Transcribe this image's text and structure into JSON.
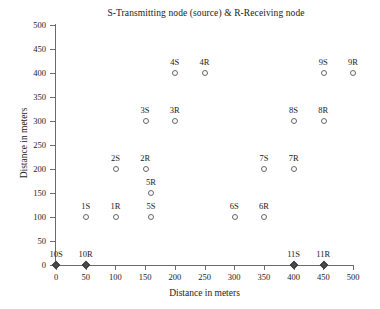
{
  "chart_data": {
    "type": "scatter",
    "title": "S-Transmitting node (source) & R-Receiving node",
    "xlabel": "Distance in meters",
    "ylabel": "Distance in meters",
    "xlim": [
      0,
      500
    ],
    "ylim": [
      0,
      500
    ],
    "xticks": [
      0,
      50,
      100,
      150,
      200,
      250,
      300,
      350,
      400,
      450,
      500
    ],
    "yticks": [
      0,
      50,
      100,
      150,
      200,
      250,
      300,
      350,
      400,
      450,
      500
    ],
    "grid": false,
    "legend": null,
    "marker": "open-circle",
    "points": [
      {
        "label": "1S",
        "x": 50,
        "y": 100,
        "marker": "open-circle"
      },
      {
        "label": "1R",
        "x": 100,
        "y": 100,
        "marker": "open-circle"
      },
      {
        "label": "2S",
        "x": 100,
        "y": 200,
        "marker": "open-circle"
      },
      {
        "label": "2R",
        "x": 150,
        "y": 200,
        "marker": "open-circle"
      },
      {
        "label": "3S",
        "x": 150,
        "y": 300,
        "marker": "open-circle"
      },
      {
        "label": "3R",
        "x": 200,
        "y": 300,
        "marker": "open-circle"
      },
      {
        "label": "4S",
        "x": 200,
        "y": 400,
        "marker": "open-circle"
      },
      {
        "label": "4R",
        "x": 250,
        "y": 400,
        "marker": "open-circle"
      },
      {
        "label": "5S",
        "x": 160,
        "y": 100,
        "marker": "open-circle"
      },
      {
        "label": "5R",
        "x": 160,
        "y": 150,
        "marker": "open-circle"
      },
      {
        "label": "6S",
        "x": 300,
        "y": 100,
        "marker": "open-circle"
      },
      {
        "label": "6R",
        "x": 350,
        "y": 100,
        "marker": "open-circle"
      },
      {
        "label": "7S",
        "x": 350,
        "y": 200,
        "marker": "open-circle"
      },
      {
        "label": "7R",
        "x": 400,
        "y": 200,
        "marker": "open-circle"
      },
      {
        "label": "8S",
        "x": 400,
        "y": 300,
        "marker": "open-circle"
      },
      {
        "label": "8R",
        "x": 450,
        "y": 300,
        "marker": "open-circle"
      },
      {
        "label": "9S",
        "x": 450,
        "y": 400,
        "marker": "open-circle"
      },
      {
        "label": "9R",
        "x": 500,
        "y": 400,
        "marker": "open-circle"
      },
      {
        "label": "10S",
        "x": 0,
        "y": 0,
        "marker": "filled-diamond"
      },
      {
        "label": "10R",
        "x": 50,
        "y": 0,
        "marker": "filled-diamond"
      },
      {
        "label": "11S",
        "x": 400,
        "y": 0,
        "marker": "filled-diamond"
      },
      {
        "label": "11R",
        "x": 450,
        "y": 0,
        "marker": "filled-diamond"
      }
    ]
  },
  "colors": {
    "axis": "#6b6b6b",
    "marker_outline": "#666666",
    "marker_fill": "#4a4a4a",
    "text": "#1a1a1a",
    "background": "#ffffff"
  }
}
